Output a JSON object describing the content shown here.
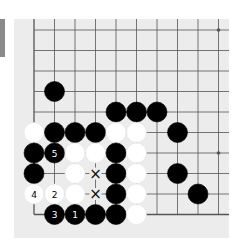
{
  "board": {
    "description": "Go (baduk) problem diagram, lower-left corner",
    "origin_x": 34,
    "origin_y": 30,
    "spacing": 20.5,
    "cols": 10,
    "rows": 10,
    "edges": {
      "left": true,
      "bottom": true,
      "top": false,
      "right": false
    },
    "star_points": [
      [
        9,
        0
      ],
      [
        9,
        6
      ]
    ],
    "colors": {
      "background": "#ececec",
      "line": "#555555",
      "black": "#000000",
      "white": "#ffffff",
      "tab": "#8a8a8a"
    },
    "stones": [
      {
        "c": 1,
        "r": 3,
        "color": "black"
      },
      {
        "c": 4,
        "r": 4,
        "color": "black"
      },
      {
        "c": 5,
        "r": 4,
        "color": "black"
      },
      {
        "c": 6,
        "r": 4,
        "color": "black"
      },
      {
        "c": 0,
        "r": 5,
        "color": "white"
      },
      {
        "c": 1,
        "r": 5,
        "color": "black"
      },
      {
        "c": 2,
        "r": 5,
        "color": "black"
      },
      {
        "c": 3,
        "r": 5,
        "color": "black"
      },
      {
        "c": 4,
        "r": 5,
        "color": "white"
      },
      {
        "c": 5,
        "r": 5,
        "color": "white"
      },
      {
        "c": 7,
        "r": 5,
        "color": "black"
      },
      {
        "c": 0,
        "r": 6,
        "color": "black"
      },
      {
        "c": 1,
        "r": 6,
        "color": "black",
        "label": "5"
      },
      {
        "c": 2,
        "r": 6,
        "color": "white"
      },
      {
        "c": 3,
        "r": 6,
        "color": "white"
      },
      {
        "c": 4,
        "r": 6,
        "color": "black"
      },
      {
        "c": 5,
        "r": 6,
        "color": "white"
      },
      {
        "c": 0,
        "r": 7,
        "color": "black"
      },
      {
        "c": 2,
        "r": 7,
        "color": "white"
      },
      {
        "c": 4,
        "r": 7,
        "color": "black"
      },
      {
        "c": 5,
        "r": 7,
        "color": "white"
      },
      {
        "c": 7,
        "r": 7,
        "color": "black"
      },
      {
        "c": 0,
        "r": 8,
        "color": "white",
        "label": "4"
      },
      {
        "c": 1,
        "r": 8,
        "color": "white",
        "label": "2"
      },
      {
        "c": 2,
        "r": 8,
        "color": "white"
      },
      {
        "c": 4,
        "r": 8,
        "color": "black"
      },
      {
        "c": 5,
        "r": 8,
        "color": "white"
      },
      {
        "c": 8,
        "r": 8,
        "color": "black"
      },
      {
        "c": 1,
        "r": 9,
        "color": "black",
        "label": "3"
      },
      {
        "c": 2,
        "r": 9,
        "color": "black",
        "label": "1"
      },
      {
        "c": 3,
        "r": 9,
        "color": "black"
      },
      {
        "c": 4,
        "r": 9,
        "color": "black"
      },
      {
        "c": 5,
        "r": 9,
        "color": "white"
      }
    ],
    "marks": [
      {
        "c": 3,
        "r": 7,
        "symbol": "×"
      },
      {
        "c": 3,
        "r": 8,
        "symbol": "×"
      }
    ]
  }
}
